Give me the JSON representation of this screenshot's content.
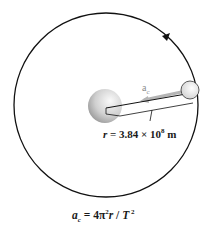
{
  "diagram": {
    "orbit": {
      "cx": 106,
      "cy": 105,
      "r": 92,
      "direction": "counterclockwise",
      "stroke": "#111111"
    },
    "earth": {
      "cx": 105,
      "cy": 106,
      "r": 17,
      "fill_light": "#f2f2f2",
      "fill_dark": "#9a9a9a"
    },
    "moon": {
      "cx": 190,
      "cy": 90,
      "r": 9,
      "fill": "#e6e6e6"
    },
    "acceleration_arrow": {
      "label": "a",
      "subscript": "c",
      "color": "#b0b0b0"
    },
    "radius_label": {
      "var": "r",
      "eq": " = 3.84 × 10",
      "exp": "8",
      "unit": " m"
    },
    "formula": {
      "lhs": "a",
      "lhs_sub": "c",
      "eq": " = 4π",
      "pi_exp": "2",
      "r": "r",
      "div": " / ",
      "T": "T",
      "T_exp": " 2"
    }
  }
}
